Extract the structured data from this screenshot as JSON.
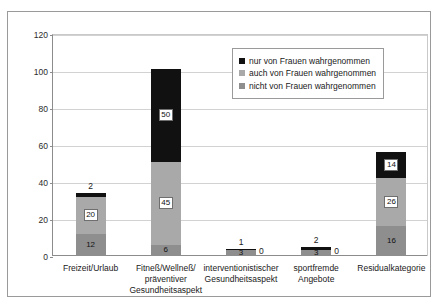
{
  "chart_data": {
    "type": "bar",
    "subtype": "stacked-bar",
    "title": "",
    "xlabel": "",
    "ylabel": "",
    "ylim": [
      0,
      120
    ],
    "ytick_labels": [
      "0",
      "20",
      "40",
      "60",
      "80",
      "100",
      "120"
    ],
    "yticks": [
      0,
      20,
      40,
      60,
      80,
      100,
      120
    ],
    "grid": true,
    "legend_position": "top-right-inside",
    "categories": [
      "Freizeit/Urlaub",
      "Fitneß/Wellneß/ präventiver Gesundheitsaspekt",
      "interventionistischer Gesundheitsaspekt",
      "sportfremde Angebote",
      "Residualkategorie"
    ],
    "category_lines": [
      [
        "Freizeit/Urlaub"
      ],
      [
        "Fitneß/Wellneß/",
        "präventiver",
        "Gesundheitsaspekt"
      ],
      [
        "interventionistischer",
        "Gesundheitsaspekt"
      ],
      [
        "sportfremde",
        "Angebote"
      ],
      [
        "Residualkategorie"
      ]
    ],
    "series": [
      {
        "name": "nicht von Frauen wahrgenommen",
        "color": "#8e8e8e",
        "values": [
          12,
          6,
          3,
          3,
          16
        ],
        "labels": [
          "12",
          "6",
          "3",
          "3",
          "16"
        ]
      },
      {
        "name": "auch von Frauen wahrgenommen",
        "color": "#a9a9a9",
        "values": [
          20,
          45,
          0,
          0,
          26
        ],
        "labels": [
          "20",
          "45",
          "0",
          "0",
          "26"
        ]
      },
      {
        "name": "nur von Frauen wahrgenommen",
        "color": "#111111",
        "values": [
          2,
          50,
          1,
          2,
          14
        ],
        "labels": [
          "2",
          "50",
          "1",
          "2",
          "14"
        ]
      }
    ],
    "totals": [
      34,
      101,
      4,
      5,
      56
    ]
  },
  "legend": {
    "items": [
      {
        "label": "nur von Frauen wahrgenommen",
        "color": "#111111"
      },
      {
        "label": "auch von Frauen wahrgenommen",
        "color": "#a9a9a9"
      },
      {
        "label": "nicht von Frauen wahrgenommen",
        "color": "#8e8e8e"
      }
    ]
  },
  "bars": [
    {
      "category_lines": [
        "Freizeit/Urlaub"
      ],
      "bottom": {
        "label": "12",
        "value": 12,
        "label_style": "plain"
      },
      "middle": {
        "label": "20",
        "value": 20,
        "label_style": "boxed"
      },
      "top": {
        "label": "2",
        "value": 2,
        "label_style": "above"
      },
      "zero_label": ""
    },
    {
      "category_lines": [
        "Fitneß/Wellneß/",
        "präventiver",
        "Gesundheitsaspekt"
      ],
      "bottom": {
        "label": "6",
        "value": 6,
        "label_style": "plain"
      },
      "middle": {
        "label": "45",
        "value": 45,
        "label_style": "boxed"
      },
      "top": {
        "label": "50",
        "value": 50,
        "label_style": "boxed"
      },
      "zero_label": ""
    },
    {
      "category_lines": [
        "interventionistischer",
        "Gesundheitsaspekt"
      ],
      "bottom": {
        "label": "3",
        "value": 3,
        "label_style": "plain"
      },
      "middle": {
        "label": "0",
        "value": 0,
        "label_style": "hidden"
      },
      "top": {
        "label": "1",
        "value": 1,
        "label_style": "above"
      },
      "zero_label": "0"
    },
    {
      "category_lines": [
        "sportfremde",
        "Angebote"
      ],
      "bottom": {
        "label": "3",
        "value": 3,
        "label_style": "plain"
      },
      "middle": {
        "label": "0",
        "value": 0,
        "label_style": "hidden"
      },
      "top": {
        "label": "2",
        "value": 2,
        "label_style": "above"
      },
      "zero_label": "0"
    },
    {
      "category_lines": [
        "Residualkategorie"
      ],
      "bottom": {
        "label": "16",
        "value": 16,
        "label_style": "plain"
      },
      "middle": {
        "label": "26",
        "value": 26,
        "label_style": "boxed"
      },
      "top": {
        "label": "14",
        "value": 14,
        "label_style": "boxed"
      },
      "zero_label": ""
    }
  ]
}
